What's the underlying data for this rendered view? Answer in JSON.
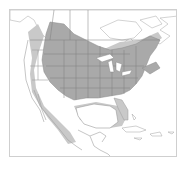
{
  "map": {
    "subject": "Range map of North America",
    "region": "North America (Canada, United States, Mexico, Caribbean)",
    "legend": {
      "primary_range": {
        "description": "Main range (dark gray)",
        "color": "#a9a9a9"
      },
      "secondary_range": {
        "description": "Outer/winter range (light gray)",
        "color": "#c9c9c9"
      },
      "land": {
        "color": "#ffffff"
      },
      "borders": {
        "color": "#7a7a7a"
      }
    },
    "frame_color": "#cfcfcf"
  }
}
